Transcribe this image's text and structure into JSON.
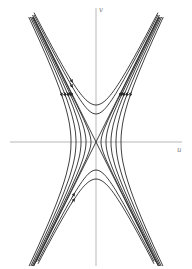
{
  "diagram": {
    "type": "phase-portrait",
    "axes": {
      "x_label": "u",
      "y_label": "v",
      "origin_px": [
        96,
        142
      ]
    },
    "colors": {
      "curve": "#2a2a2a",
      "axis": "#999999",
      "background": "#ffffff"
    },
    "families": {
      "vertical_hyperbolas": [
        37,
        28
      ],
      "horizontal_hyperbolas": [
        5,
        10,
        15,
        20,
        25
      ],
      "separatrices": true
    }
  }
}
